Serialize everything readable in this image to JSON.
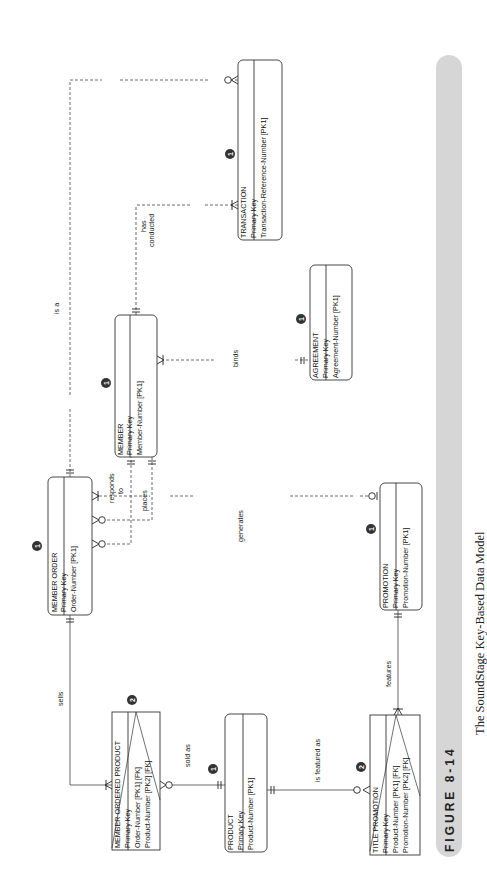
{
  "figure": {
    "label": "FIGURE 8-14",
    "title": "The SoundStage Key-Based Data Model",
    "band_color": "#d4d4d4"
  },
  "entities": [
    {
      "name": "MEMBER ORDER",
      "key_label": "Primary Key",
      "attributes": [
        "Order-Number  [PK1]"
      ],
      "badge": "1"
    },
    {
      "name": "MEMBER",
      "key_label": "Primary Key",
      "attributes": [
        "Member-Number  [PK1]"
      ],
      "badge": "1"
    },
    {
      "name": "TRANSACTION",
      "key_label": "Primary Key",
      "attributes": [
        "Transaction-Reference-Number  [PK1]"
      ],
      "badge": "1"
    },
    {
      "name": "AGREEMENT",
      "key_label": "Primary Key",
      "attributes": [
        "Agreement-Number  [PK1]"
      ],
      "badge": "1"
    },
    {
      "name": "PROMOTION",
      "key_label": "Primary Key",
      "attributes": [
        "Promotion-Number  [PK1]"
      ],
      "badge": "1"
    },
    {
      "name": "MEMBER ORDERED PRODUCT",
      "key_label": "Primary Key",
      "attributes": [
        "Order-Number  [PK1] [FK]",
        "Product-Number  [PK2] [FK]"
      ],
      "badge": "2"
    },
    {
      "name": "PRODUCT",
      "key_label": "Primary Key",
      "attributes": [
        "Product-Number  [PK1]"
      ],
      "badge": "1"
    },
    {
      "name": "TITLE PROMOTION",
      "key_label": "Primary Key",
      "attributes": [
        "Product-Number  [PK1] [FK]",
        "Promotion-Number  [PK2] [FK]"
      ],
      "badge": "2"
    }
  ],
  "relationships": [
    {
      "label": "is a"
    },
    {
      "label": "has conducted",
      "line1": "has",
      "line2": "conducted"
    },
    {
      "label": "responds to",
      "line1": "responds",
      "line2": "to"
    },
    {
      "label": "places"
    },
    {
      "label": "binds"
    },
    {
      "label": "generates"
    },
    {
      "label": "sells"
    },
    {
      "label": "sold as"
    },
    {
      "label": "is featured as"
    },
    {
      "label": "features"
    }
  ]
}
